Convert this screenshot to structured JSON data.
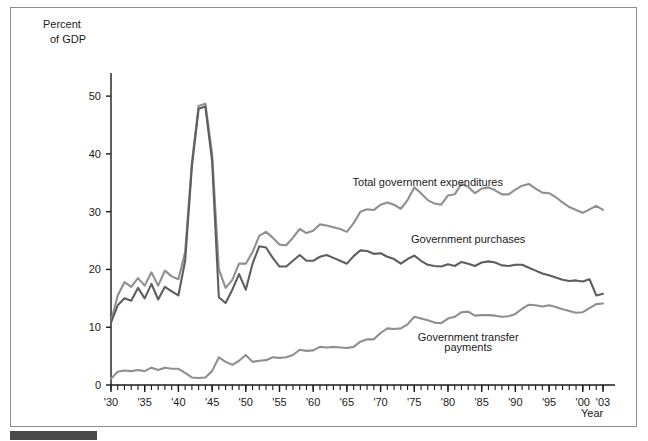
{
  "figure": {
    "y_axis_title_line1": "Percent",
    "y_axis_title_line2": "of GDP",
    "x_axis_title": "Year"
  },
  "colors": {
    "total_expenditures": "#8f8f8f",
    "government_purchases": "#5e5e5e",
    "transfer_payments": "#8f8f8f",
    "axis": "#1a1a1a",
    "frame": "#8d8d8d",
    "source_bar": "#4a4a4a"
  },
  "chart_data": {
    "type": "line",
    "title": "",
    "xlabel": "Year",
    "ylabel": "Percent of GDP",
    "xlim": [
      1930,
      2003
    ],
    "ylim": [
      0,
      54
    ],
    "yticks": [
      0,
      10,
      20,
      30,
      40,
      50
    ],
    "ytick_labels": [
      "0",
      "10",
      "20",
      "30",
      "40",
      "50"
    ],
    "xticks": [
      1930,
      1935,
      1940,
      1945,
      1950,
      1955,
      1960,
      1965,
      1970,
      1975,
      1980,
      1985,
      1990,
      1995,
      2000,
      2003
    ],
    "xtick_labels": [
      "'30",
      "'35",
      "'40",
      "'45",
      "'50",
      "'55",
      "'60",
      "'65",
      "'70",
      "'75",
      "'80",
      "'85",
      "'90",
      "'95",
      "'00",
      "'03"
    ],
    "minor_xtick_interval": 1,
    "grid": false,
    "legend": "inline-annotations",
    "annotations": [
      {
        "text": "Total government expenditures",
        "x": 1977,
        "y": 34.5
      },
      {
        "text": "Government purchases",
        "x": 1983,
        "y": 24.6
      },
      {
        "text": "Government transfer",
        "x": 1983,
        "y": 7.6
      },
      {
        "text": "payments",
        "x": 1983,
        "y": 5.9
      }
    ],
    "x": [
      1930,
      1931,
      1932,
      1933,
      1934,
      1935,
      1936,
      1937,
      1938,
      1939,
      1940,
      1941,
      1942,
      1943,
      1944,
      1945,
      1946,
      1947,
      1948,
      1949,
      1950,
      1951,
      1952,
      1953,
      1954,
      1955,
      1956,
      1957,
      1958,
      1959,
      1960,
      1961,
      1962,
      1963,
      1964,
      1965,
      1966,
      1967,
      1968,
      1969,
      1970,
      1971,
      1972,
      1973,
      1974,
      1975,
      1976,
      1977,
      1978,
      1979,
      1980,
      1981,
      1982,
      1983,
      1984,
      1985,
      1986,
      1987,
      1988,
      1989,
      1990,
      1991,
      1992,
      1993,
      1994,
      1995,
      1996,
      1997,
      1998,
      1999,
      2000,
      2001,
      2002,
      2003
    ],
    "series": [
      {
        "name": "Total government expenditures",
        "color": "#8f8f8f",
        "values": [
          11.0,
          15.5,
          17.8,
          17.0,
          18.5,
          17.2,
          19.5,
          17.2,
          19.8,
          18.8,
          18.3,
          23.0,
          38.5,
          48.3,
          48.7,
          40.0,
          20.0,
          16.8,
          18.2,
          21.0,
          21.0,
          23.0,
          25.8,
          26.5,
          25.5,
          24.3,
          24.2,
          25.5,
          27.0,
          26.3,
          26.7,
          27.8,
          27.6,
          27.3,
          27.0,
          26.5,
          28.0,
          30.0,
          30.4,
          30.3,
          31.2,
          31.6,
          31.2,
          30.5,
          32.0,
          34.2,
          33.2,
          32.0,
          31.4,
          31.2,
          32.8,
          33.0,
          34.8,
          34.3,
          33.2,
          34.0,
          34.2,
          33.7,
          33.0,
          33.0,
          33.8,
          34.5,
          34.8,
          34.0,
          33.3,
          33.2,
          32.5,
          31.6,
          30.8,
          30.3,
          29.8,
          30.4,
          31.0,
          30.3
        ]
      },
      {
        "name": "Government purchases",
        "color": "#5e5e5e",
        "values": [
          10.8,
          13.8,
          15.0,
          14.6,
          16.8,
          15.0,
          17.5,
          14.8,
          17.0,
          16.2,
          15.5,
          21.5,
          37.8,
          47.8,
          48.2,
          38.8,
          15.2,
          14.2,
          16.5,
          19.2,
          16.5,
          21.0,
          24.0,
          23.8,
          22.0,
          20.5,
          20.5,
          21.5,
          22.5,
          21.5,
          21.5,
          22.2,
          22.5,
          22.0,
          21.5,
          21.0,
          22.3,
          23.3,
          23.2,
          22.7,
          22.8,
          22.2,
          21.8,
          21.0,
          21.8,
          22.4,
          21.5,
          20.8,
          20.6,
          20.5,
          20.9,
          20.6,
          21.3,
          21.0,
          20.6,
          21.2,
          21.4,
          21.2,
          20.7,
          20.6,
          20.8,
          20.8,
          20.3,
          19.8,
          19.3,
          19.0,
          18.6,
          18.2,
          18.0,
          18.1,
          17.9,
          18.3,
          15.5,
          15.8
        ]
      },
      {
        "name": "Government transfer payments",
        "color": "#8f8f8f",
        "values": [
          1.1,
          2.3,
          2.5,
          2.4,
          2.6,
          2.4,
          3.0,
          2.6,
          3.0,
          2.8,
          2.8,
          2.1,
          1.3,
          1.2,
          1.3,
          2.4,
          4.8,
          4.0,
          3.5,
          4.2,
          5.2,
          4.0,
          4.2,
          4.3,
          4.8,
          4.7,
          4.8,
          5.2,
          6.1,
          5.9,
          6.0,
          6.6,
          6.5,
          6.6,
          6.5,
          6.4,
          6.6,
          7.5,
          7.9,
          7.9,
          9.0,
          9.8,
          9.7,
          9.8,
          10.5,
          11.8,
          11.5,
          11.2,
          10.8,
          10.7,
          11.5,
          11.8,
          12.6,
          12.7,
          12.0,
          12.1,
          12.1,
          12.0,
          11.8,
          11.9,
          12.3,
          13.2,
          13.9,
          13.8,
          13.6,
          13.8,
          13.5,
          13.1,
          12.8,
          12.5,
          12.6,
          13.3,
          14.0,
          14.1
        ]
      }
    ]
  }
}
